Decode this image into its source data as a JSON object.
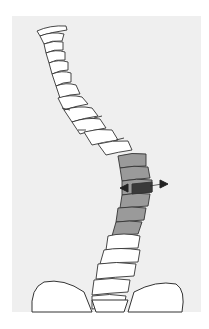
{
  "figure": {
    "colors": {
      "background": "#ffffff",
      "panel": "#efefef",
      "bone": "#ffffff",
      "outline": "#333333",
      "highlight": "#9a9a9a",
      "wedge": "#3a3a3a"
    }
  }
}
